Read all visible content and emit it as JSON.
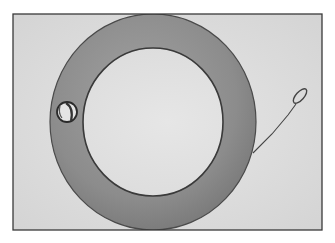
{
  "image": {
    "description": "Black-and-white photograph of a large flat metal ring (washer) with a small hole on the left side, and a thin wire extending from the right edge ending in a small loop, inside a thin dark border.",
    "colors": {
      "page_background": "#ffffff",
      "photo_background": "#dcdcdc",
      "border": "#3a3a3a",
      "ring": "#8c8c8c",
      "ring_edge": "#4a4a4a",
      "wire": "#444444"
    },
    "objects": [
      {
        "name": "metal-ring",
        "shape": "annulus"
      },
      {
        "name": "ring-hole",
        "shape": "small circle"
      },
      {
        "name": "wire-with-loop",
        "shape": "line with oval loop"
      }
    ]
  }
}
